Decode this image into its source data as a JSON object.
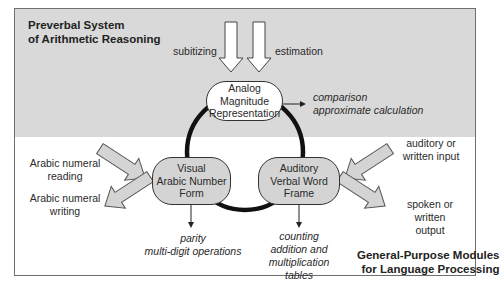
{
  "sections": {
    "top_title_line1": "Preverbal System",
    "top_title_line2": "of Arithmetic Reasoning",
    "bottom_title_line1": "General-Purpose Modules",
    "bottom_title_line2": "for Language Processing"
  },
  "inputs": {
    "subitizing": "subitizing",
    "estimation": "estimation"
  },
  "nodes": {
    "analog": {
      "line1": "Analog",
      "line2": "Magnitude",
      "line3": "Representation"
    },
    "visual": {
      "line1": "Visual",
      "line2": "Arabic Number",
      "line3": "Form"
    },
    "auditory": {
      "line1": "Auditory",
      "line2": "Verbal Word",
      "line3": "Frame"
    }
  },
  "outputs": {
    "analog_line1": "comparison",
    "analog_line2": "approximate calculation",
    "visual_line1": "parity",
    "visual_line2": "multi-digit operations",
    "auditory_line1": "counting",
    "auditory_line2": "addition and",
    "auditory_line3": "multiplication",
    "auditory_line4": "tables"
  },
  "io_labels": {
    "arabic_reading_line1": "Arabic numeral",
    "arabic_reading_line2": "reading",
    "arabic_writing_line1": "Arabic numeral",
    "arabic_writing_line2": "writing",
    "aud_input_line1": "auditory or",
    "aud_input_line2": "written input",
    "spoken_line1": "spoken or",
    "spoken_line2": "written",
    "spoken_line3": "output"
  },
  "colors": {
    "top_panel": "#d9d9d9",
    "node_fill_grey": "#d4d4d4",
    "node_fill_white": "#ffffff",
    "loop": "#111111",
    "border": "#6f6f6f"
  }
}
